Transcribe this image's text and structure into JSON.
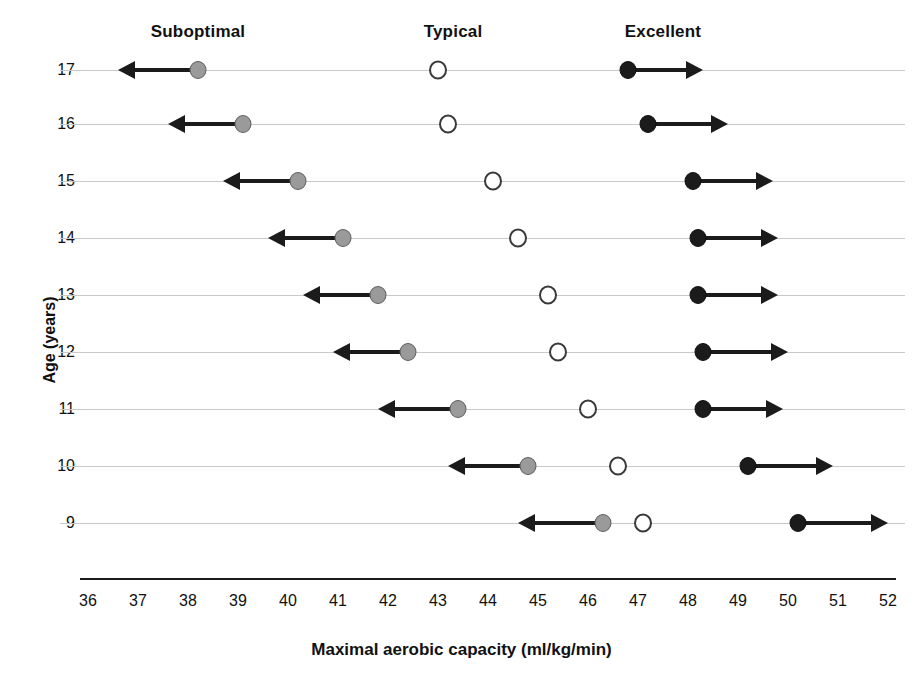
{
  "chart_data": {
    "type": "scatter",
    "title": "",
    "xlabel": "Maximal aerobic capacity (ml/kg/min)",
    "ylabel": "Age (years)",
    "xlim": [
      36,
      52
    ],
    "xticks": [
      36,
      37,
      38,
      39,
      40,
      41,
      42,
      43,
      44,
      45,
      46,
      47,
      48,
      49,
      50,
      51,
      52
    ],
    "categories": [
      "17",
      "16",
      "15",
      "14",
      "13",
      "12",
      "11",
      "10",
      "9"
    ],
    "grid": true,
    "legend_position": "top",
    "zone_labels": [
      "Suboptimal",
      "Typical",
      "Excellent"
    ],
    "series": [
      {
        "name": "Suboptimal",
        "marker": "filled-gray-circle",
        "color": "#9a9a9a",
        "direction": "left",
        "values": [
          38.2,
          39.1,
          40.2,
          41.1,
          41.8,
          42.4,
          43.4,
          44.8,
          46.3
        ],
        "arrow_tips": [
          36.6,
          37.6,
          38.7,
          39.6,
          40.3,
          40.9,
          41.8,
          43.2,
          44.6
        ]
      },
      {
        "name": "Typical",
        "marker": "open-circle",
        "color": "#ffffff",
        "direction": "none",
        "values": [
          43.0,
          43.2,
          44.1,
          44.6,
          45.2,
          45.4,
          46.0,
          46.6,
          47.1
        ]
      },
      {
        "name": "Excellent",
        "marker": "filled-black-circle",
        "color": "#1b1b1b",
        "direction": "right",
        "values": [
          46.8,
          47.2,
          48.1,
          48.2,
          48.2,
          48.3,
          48.3,
          49.2,
          50.2
        ],
        "arrow_tips": [
          48.3,
          48.8,
          49.7,
          49.8,
          49.8,
          50.0,
          49.9,
          50.9,
          52.0
        ]
      }
    ],
    "zone_label_positions": [
      38.2,
      43.3,
      47.5
    ]
  }
}
